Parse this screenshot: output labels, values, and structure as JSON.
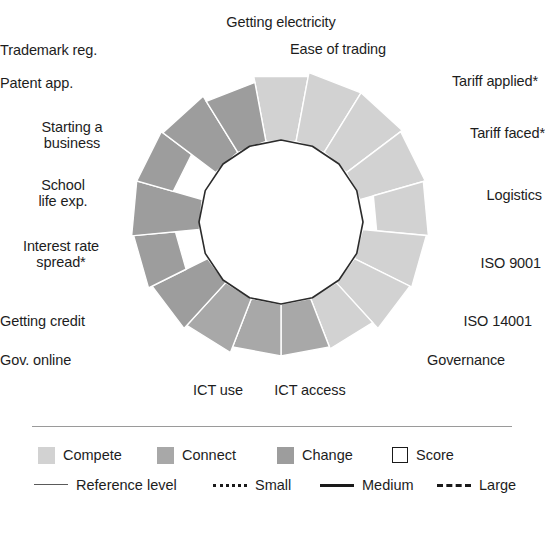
{
  "chart_data": {
    "type": "radar",
    "title": "",
    "subtitle": "",
    "xlabel": "",
    "ylabel": "",
    "center": {
      "x": 281,
      "y": 222
    },
    "inner_radius": 82,
    "max_radius": 152,
    "grid": false,
    "legend_position": "bottom",
    "note": "Rose / polar sector chart. Each of the 16 indicators is drawn as a wedge whose shaded band runs from an inner radius to an outer radius. The thin dark polygon is the Score reference level.",
    "categories": [
      "Getting electricity",
      "Ease of trading",
      "Tariff applied*",
      "Tariff faced*",
      "Logistics",
      "ISO 9001",
      "ISO 14001",
      "Governance",
      "ICT access",
      "ICT use",
      "Gov. online",
      "Getting credit",
      "Interest rate spread*",
      "School life exp.",
      "Starting a business",
      "Patent app.",
      "Trademark reg."
    ],
    "series": [
      {
        "name": "Compete",
        "color": "#d2d2d2",
        "indicators": [
          {
            "label": "Getting electricity",
            "group": "Compete",
            "inner": 82,
            "outer": 148
          },
          {
            "label": "Ease of trading",
            "group": "Compete",
            "inner": 82,
            "outer": 152
          },
          {
            "label": "Tariff applied*",
            "group": "Compete",
            "inner": 82,
            "outer": 152
          },
          {
            "label": "Tariff faced*",
            "group": "Compete",
            "inner": 82,
            "outer": 150
          },
          {
            "label": "Logistics",
            "group": "Compete",
            "inner": 96,
            "outer": 148
          },
          {
            "label": "ISO 9001",
            "group": "Compete",
            "inner": 82,
            "outer": 146
          },
          {
            "label": "ISO 14001",
            "group": "Compete",
            "inner": 82,
            "outer": 144
          },
          {
            "label": "Governance",
            "group": "Compete",
            "inner": 82,
            "outer": 136
          }
        ]
      },
      {
        "name": "Connect",
        "color": "#a8a8a8",
        "indicators": [
          {
            "label": "ICT access",
            "group": "Connect",
            "inner": 82,
            "outer": 134
          },
          {
            "label": "ICT use",
            "group": "Connect",
            "inner": 82,
            "outer": 134
          },
          {
            "label": "Gov. online",
            "group": "Connect",
            "inner": 82,
            "outer": 140
          }
        ]
      },
      {
        "name": "Change",
        "color": "#9d9d9d",
        "indicators": [
          {
            "label": "Getting credit",
            "group": "Change",
            "inner": 82,
            "outer": 144
          },
          {
            "label": "Interest rate spread*",
            "group": "Change",
            "inner": 106,
            "outer": 148
          },
          {
            "label": "School life exp.",
            "group": "Change",
            "inner": 82,
            "outer": 150
          },
          {
            "label": "Starting a business",
            "group": "Change",
            "inner": 112,
            "outer": 150
          },
          {
            "label": "Patent app.",
            "group": "Change",
            "inner": 82,
            "outer": 148
          },
          {
            "label": "Trademark reg.",
            "group": "Change",
            "inner": 82,
            "outer": 142
          }
        ]
      }
    ],
    "score_polygon": {
      "label": "Score",
      "radius": 82,
      "sides": 16,
      "stroke": "#2b2b2b"
    }
  },
  "axis_labels": [
    {
      "id": "getting-electricity",
      "text": "Getting electricity"
    },
    {
      "id": "ease-of-trading",
      "text": "Ease of trading"
    },
    {
      "id": "tariff-applied",
      "text": "Tariff applied*"
    },
    {
      "id": "tariff-faced",
      "text": "Tariff faced*"
    },
    {
      "id": "logistics",
      "text": "Logistics"
    },
    {
      "id": "iso-9001",
      "text": "ISO 9001"
    },
    {
      "id": "iso-14001",
      "text": "ISO 14001"
    },
    {
      "id": "governance",
      "text": "Governance"
    },
    {
      "id": "ict-access",
      "text": "ICT access"
    },
    {
      "id": "ict-use",
      "text": "ICT use"
    },
    {
      "id": "gov-online",
      "text": "Gov. online"
    },
    {
      "id": "getting-credit",
      "text": "Getting credit"
    },
    {
      "id": "interest-rate-spread",
      "text": "Interest rate\nspread*"
    },
    {
      "id": "school-life-exp",
      "text": "School\nlife exp."
    },
    {
      "id": "starting-a-business",
      "text": "Starting a\nbusiness"
    },
    {
      "id": "patent-app",
      "text": "Patent app."
    },
    {
      "id": "trademark-reg",
      "text": "Trademark reg."
    }
  ],
  "legend": {
    "swatches": [
      {
        "label": "Compete",
        "color": "#d2d2d2",
        "style": "fill"
      },
      {
        "label": "Connect",
        "color": "#a8a8a8",
        "style": "fill"
      },
      {
        "label": "Change",
        "color": "#9d9d9d",
        "style": "fill"
      },
      {
        "label": "Score",
        "color": "#ffffff",
        "style": "outline"
      }
    ],
    "lines": [
      {
        "label": "Reference level",
        "style": "solid-thin"
      },
      {
        "label": "Small",
        "style": "dotted"
      },
      {
        "label": "Medium",
        "style": "solid-thick"
      },
      {
        "label": "Large",
        "style": "dashed"
      }
    ]
  }
}
